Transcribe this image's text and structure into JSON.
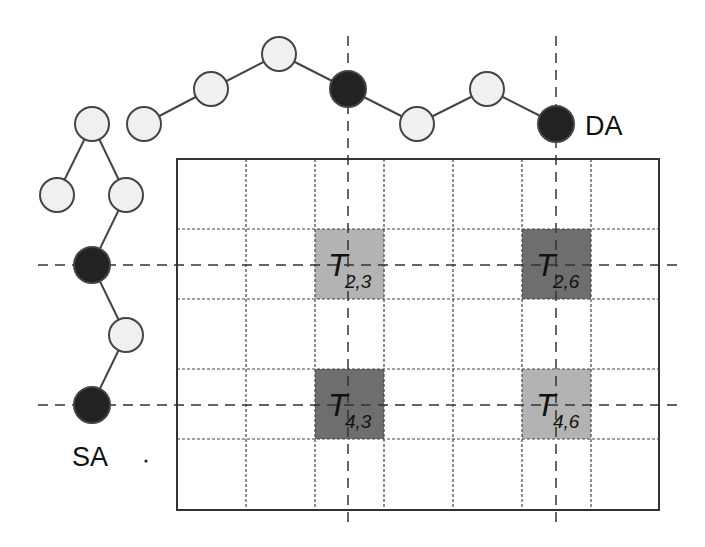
{
  "labels": {
    "source": "SA",
    "destination": "DA"
  },
  "tiles": [
    {
      "main": "T",
      "sub": "2,3",
      "row": 2,
      "col": 3,
      "shade": "light"
    },
    {
      "main": "T",
      "sub": "2,6",
      "row": 2,
      "col": 6,
      "shade": "dark"
    },
    {
      "main": "T",
      "sub": "4,3",
      "row": 4,
      "col": 3,
      "shade": "dark"
    },
    {
      "main": "T",
      "sub": "4,6",
      "row": 4,
      "col": 6,
      "shade": "light"
    }
  ],
  "grid": {
    "rows": 5,
    "cols": 7
  },
  "colors": {
    "light_tile": "#b3b3b3",
    "dark_tile": "#6e6e6e",
    "node_fill_light": "#f0f0f0",
    "node_fill_dark": "#222222",
    "line": "#444444"
  }
}
